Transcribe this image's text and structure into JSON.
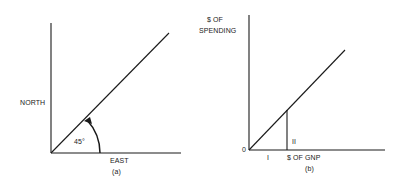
{
  "panel_a": {
    "y_axis_label": "NORTH",
    "x_axis_label": "EAST",
    "angle_label": "45°",
    "caption": "(a)"
  },
  "panel_b": {
    "y_axis_label_line1": "$ OF",
    "y_axis_label_line2": "SPENDING",
    "origin_label": "0",
    "x_axis_label": "$ OF GNP",
    "region_i_label": "I",
    "region_ii_label": "II",
    "caption": "(b)"
  },
  "colors": {
    "ink": "#1a1a1a",
    "background": "#ffffff"
  }
}
